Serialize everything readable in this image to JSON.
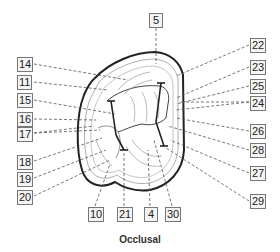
{
  "figure": {
    "caption": "Occlusal",
    "labels": {
      "left": [
        {
          "text": "14",
          "x": 17,
          "y": 57
        },
        {
          "text": "11",
          "x": 17,
          "y": 75
        },
        {
          "text": "15",
          "x": 17,
          "y": 93
        },
        {
          "text": "16",
          "x": 17,
          "y": 112
        },
        {
          "text": "17",
          "x": 17,
          "y": 127
        },
        {
          "text": "18",
          "x": 17,
          "y": 155
        },
        {
          "text": "19",
          "x": 17,
          "y": 172
        },
        {
          "text": "20",
          "x": 17,
          "y": 190
        }
      ],
      "top": [
        {
          "text": "5",
          "x": 149,
          "y": 13
        }
      ],
      "right": [
        {
          "text": "22",
          "x": 250,
          "y": 38
        },
        {
          "text": "23",
          "x": 250,
          "y": 60
        },
        {
          "text": "25",
          "x": 250,
          "y": 79
        },
        {
          "text": "24",
          "x": 250,
          "y": 96
        },
        {
          "text": "26",
          "x": 250,
          "y": 124
        },
        {
          "text": "28",
          "x": 250,
          "y": 143
        },
        {
          "text": "27",
          "x": 250,
          "y": 166
        },
        {
          "text": "29",
          "x": 250,
          "y": 194
        }
      ],
      "bottom": [
        {
          "text": "10",
          "x": 88,
          "y": 207
        },
        {
          "text": "21",
          "x": 117,
          "y": 207
        },
        {
          "text": "4",
          "x": 145,
          "y": 207
        },
        {
          "text": "30",
          "x": 165,
          "y": 207
        }
      ]
    },
    "colors": {
      "outline": "#222222",
      "detail": "#888888",
      "leader": "#555555",
      "label_border": "#777777",
      "label_fill": "#f4f4f4"
    }
  }
}
